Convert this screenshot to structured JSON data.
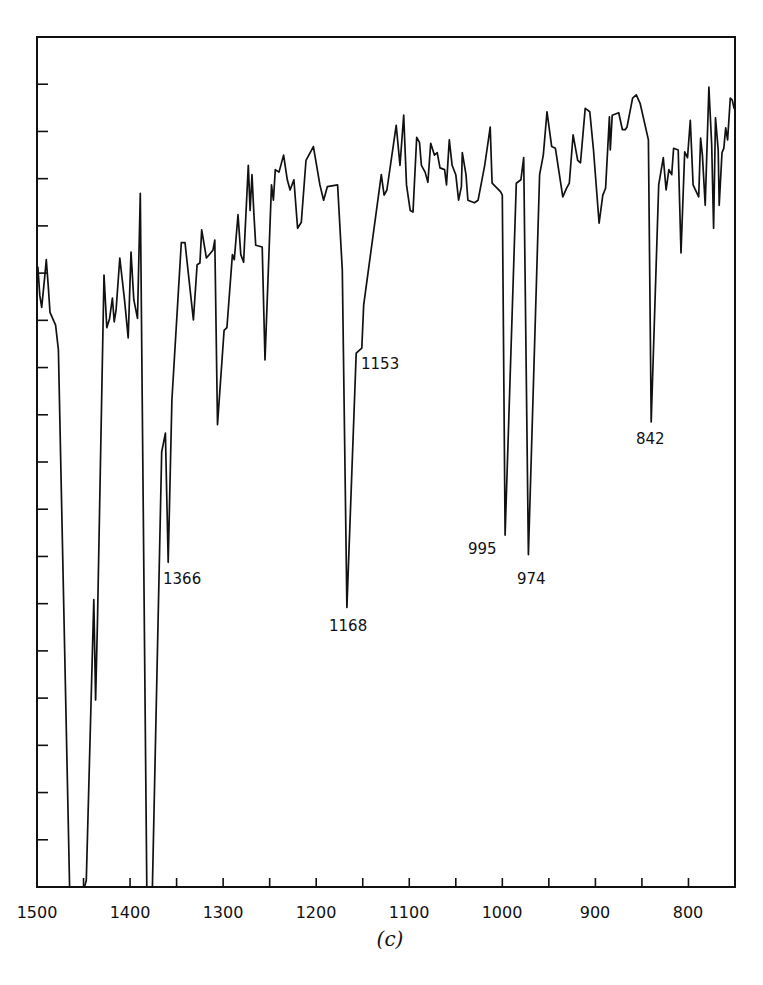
{
  "figure": {
    "caption": "(c)"
  },
  "chart_data": {
    "type": "line",
    "title": "",
    "subtitle": "(c)",
    "xlabel": "Wavenumber (cm-1)",
    "ylabel": "",
    "x_reversed": true,
    "xlim": [
      1500,
      750
    ],
    "ylim": [
      0,
      100
    ],
    "y_units": "relative transmittance (unlabeled axis)",
    "grid": false,
    "legend": null,
    "x_tick_labels": [
      1500,
      1400,
      1300,
      1200,
      1100,
      1000,
      900,
      800
    ],
    "x_minor_ticks": [
      1450,
      1400,
      1350,
      1300,
      1250,
      1200,
      1150,
      1100,
      1050,
      1000,
      950,
      900,
      850,
      800,
      750
    ],
    "y_tick_count": 17,
    "annotations": [
      {
        "text": "1366",
        "x": 1366,
        "y": 38.2
      },
      {
        "text": "1168",
        "x": 1168,
        "y": 32.9
      },
      {
        "text": "1153",
        "x": 1153,
        "y": 63.4
      },
      {
        "text": "995",
        "x": 995,
        "y": 41.4
      },
      {
        "text": "974",
        "x": 974,
        "y": 39.1
      },
      {
        "text": "842",
        "x": 842,
        "y": 54.7
      }
    ],
    "series": [
      {
        "name": "IR spectrum",
        "points": [
          [
            1499,
            72.9
          ],
          [
            1497,
            69.6
          ],
          [
            1495,
            68.2
          ],
          [
            1492,
            71.4
          ],
          [
            1490,
            73.8
          ],
          [
            1488,
            70.8
          ],
          [
            1486,
            67.6
          ],
          [
            1480,
            66.1
          ],
          [
            1477,
            63.2
          ],
          [
            1465,
            0
          ],
          [
            1449,
            0
          ],
          [
            1447,
            0.8
          ],
          [
            1439,
            33.8
          ],
          [
            1437,
            22.0
          ],
          [
            1435,
            31.4
          ],
          [
            1428,
            72.0
          ],
          [
            1425,
            65.8
          ],
          [
            1422,
            66.9
          ],
          [
            1419,
            69.3
          ],
          [
            1417,
            66.5
          ],
          [
            1415,
            67.9
          ],
          [
            1411,
            74.0
          ],
          [
            1406,
            69.1
          ],
          [
            1402,
            64.6
          ],
          [
            1399,
            74.7
          ],
          [
            1396,
            69.1
          ],
          [
            1392,
            66.9
          ],
          [
            1389,
            81.6
          ],
          [
            1382,
            0
          ],
          [
            1376,
            0
          ],
          [
            1366,
            51.2
          ],
          [
            1362,
            53.4
          ],
          [
            1359,
            38.2
          ],
          [
            1355,
            57.3
          ],
          [
            1345,
            75.8
          ],
          [
            1341,
            75.8
          ],
          [
            1332,
            66.7
          ],
          [
            1328,
            73.2
          ],
          [
            1325,
            73.4
          ],
          [
            1323,
            77.3
          ],
          [
            1318,
            74.0
          ],
          [
            1311,
            74.9
          ],
          [
            1309,
            76.1
          ],
          [
            1306,
            54.4
          ],
          [
            1299,
            65.5
          ],
          [
            1296,
            65.8
          ],
          [
            1290,
            74.4
          ],
          [
            1288,
            73.8
          ],
          [
            1284,
            79.1
          ],
          [
            1281,
            74.4
          ],
          [
            1278,
            73.5
          ],
          [
            1273,
            84.9
          ],
          [
            1271,
            79.6
          ],
          [
            1269,
            83.8
          ],
          [
            1267,
            79.4
          ],
          [
            1265,
            75.5
          ],
          [
            1258,
            75.3
          ],
          [
            1255,
            62.0
          ],
          [
            1248,
            82.6
          ],
          [
            1246,
            80.8
          ],
          [
            1244,
            84.4
          ],
          [
            1240,
            84.1
          ],
          [
            1235,
            86.1
          ],
          [
            1231,
            83.2
          ],
          [
            1228,
            82.0
          ],
          [
            1224,
            83.2
          ],
          [
            1220,
            77.5
          ],
          [
            1216,
            78.2
          ],
          [
            1211,
            85.5
          ],
          [
            1203,
            87.1
          ],
          [
            1196,
            82.6
          ],
          [
            1192,
            80.8
          ],
          [
            1188,
            82.4
          ],
          [
            1177,
            82.6
          ],
          [
            1172,
            72.6
          ],
          [
            1167,
            32.9
          ],
          [
            1157,
            62.8
          ],
          [
            1151,
            63.4
          ],
          [
            1149,
            68.5
          ],
          [
            1130,
            83.8
          ],
          [
            1127,
            81.4
          ],
          [
            1124,
            82.0
          ],
          [
            1114,
            89.6
          ],
          [
            1110,
            84.9
          ],
          [
            1106,
            90.8
          ],
          [
            1103,
            82.6
          ],
          [
            1099,
            79.6
          ],
          [
            1096,
            79.4
          ],
          [
            1092,
            88.2
          ],
          [
            1089,
            87.6
          ],
          [
            1087,
            84.9
          ],
          [
            1083,
            84.1
          ],
          [
            1080,
            82.9
          ],
          [
            1077,
            87.5
          ],
          [
            1073,
            86.1
          ],
          [
            1070,
            86.4
          ],
          [
            1067,
            84.6
          ],
          [
            1062,
            84.4
          ],
          [
            1060,
            82.6
          ],
          [
            1057,
            87.9
          ],
          [
            1054,
            84.9
          ],
          [
            1050,
            83.8
          ],
          [
            1047,
            80.8
          ],
          [
            1044,
            82.4
          ],
          [
            1043,
            86.4
          ],
          [
            1039,
            83.8
          ],
          [
            1037,
            80.8
          ],
          [
            1030,
            80.5
          ],
          [
            1026,
            80.8
          ],
          [
            1019,
            84.9
          ],
          [
            1015,
            87.9
          ],
          [
            1013,
            89.4
          ],
          [
            1011,
            82.8
          ],
          [
            1002,
            81.8
          ],
          [
            1000,
            81.4
          ],
          [
            997,
            41.4
          ],
          [
            985,
            82.8
          ],
          [
            980,
            83.2
          ],
          [
            977,
            85.8
          ],
          [
            972,
            39.1
          ],
          [
            960,
            83.8
          ],
          [
            956,
            86.1
          ],
          [
            952,
            91.2
          ],
          [
            947,
            87.1
          ],
          [
            943,
            86.9
          ],
          [
            935,
            81.2
          ],
          [
            931,
            82.2
          ],
          [
            928,
            82.8
          ],
          [
            924,
            88.5
          ],
          [
            919,
            85.5
          ],
          [
            916,
            85.2
          ],
          [
            911,
            91.6
          ],
          [
            906,
            91.2
          ],
          [
            902,
            86.7
          ],
          [
            896,
            78.1
          ],
          [
            892,
            81.4
          ],
          [
            889,
            82.2
          ],
          [
            885,
            90.6
          ],
          [
            884,
            86.7
          ],
          [
            882,
            90.8
          ],
          [
            875,
            91.1
          ],
          [
            871,
            89.1
          ],
          [
            868,
            89.1
          ],
          [
            866,
            89.4
          ],
          [
            860,
            92.8
          ],
          [
            856,
            93.2
          ],
          [
            852,
            92.2
          ],
          [
            843,
            87.9
          ],
          [
            840,
            54.7
          ],
          [
            832,
            82.6
          ],
          [
            827,
            85.8
          ],
          [
            824,
            82.0
          ],
          [
            821,
            84.4
          ],
          [
            818,
            83.8
          ],
          [
            816,
            86.9
          ],
          [
            811,
            86.7
          ],
          [
            808,
            74.6
          ],
          [
            804,
            86.5
          ],
          [
            801,
            85.8
          ],
          [
            798,
            90.2
          ],
          [
            795,
            82.6
          ],
          [
            789,
            81.2
          ],
          [
            787,
            88.1
          ],
          [
            785,
            86.1
          ],
          [
            782,
            80.2
          ],
          [
            778,
            94.1
          ],
          [
            775,
            87.3
          ],
          [
            773,
            77.5
          ],
          [
            771,
            90.5
          ],
          [
            768,
            86.7
          ],
          [
            767,
            80.2
          ],
          [
            764,
            86.4
          ],
          [
            762,
            86.9
          ],
          [
            760,
            89.3
          ],
          [
            758,
            87.9
          ],
          [
            755,
            92.8
          ],
          [
            753,
            92.6
          ],
          [
            751,
            91.6
          ]
        ]
      }
    ]
  },
  "labels": {
    "peak_1366": "1366",
    "peak_1168": "1168",
    "peak_1153": "1153",
    "peak_995": "995",
    "peak_974": "974",
    "peak_842": "842",
    "x_1500": "1500",
    "x_1400": "1400",
    "x_1300": "1300",
    "x_1200": "1200",
    "x_1100": "1100",
    "x_1000": "1000",
    "x_900": "900",
    "x_800": "800"
  }
}
